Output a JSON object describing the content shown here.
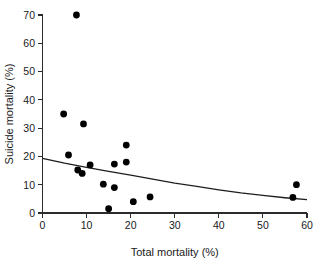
{
  "chart_data": {
    "type": "scatter",
    "title": "",
    "xlabel": "Total  mortality (%)",
    "ylabel": "Suicide mortality (%)",
    "xlim": [
      0,
      60
    ],
    "ylim": [
      0,
      70
    ],
    "xticks": [
      0,
      10,
      20,
      30,
      40,
      50,
      60
    ],
    "yticks": [
      0,
      10,
      20,
      30,
      40,
      50,
      60,
      70
    ],
    "xtick_labels": [
      "0",
      "10",
      "20",
      "30",
      "40",
      "50",
      "60"
    ],
    "ytick_labels": [
      "0",
      "10",
      "20",
      "30",
      "40",
      "50",
      "60",
      "70"
    ],
    "grid": false,
    "legend": null,
    "marker": "filled-circle",
    "marker_color": "#000000",
    "points": [
      {
        "x": 7.7,
        "y": 70.0
      },
      {
        "x": 4.8,
        "y": 35.0
      },
      {
        "x": 9.3,
        "y": 31.5
      },
      {
        "x": 19.0,
        "y": 24.0
      },
      {
        "x": 5.9,
        "y": 20.5
      },
      {
        "x": 19.0,
        "y": 18.0
      },
      {
        "x": 16.3,
        "y": 17.3
      },
      {
        "x": 10.8,
        "y": 17.0
      },
      {
        "x": 8.0,
        "y": 15.2
      },
      {
        "x": 9.0,
        "y": 14.0
      },
      {
        "x": 13.8,
        "y": 10.2
      },
      {
        "x": 16.3,
        "y": 9.0
      },
      {
        "x": 57.6,
        "y": 10.0
      },
      {
        "x": 24.4,
        "y": 5.7
      },
      {
        "x": 56.8,
        "y": 5.5
      },
      {
        "x": 20.6,
        "y": 4.0
      },
      {
        "x": 15.0,
        "y": 1.5
      }
    ],
    "fit_curve": {
      "name": "fitted-trend",
      "description": "decreasing-exponential-fit",
      "color": "#1d1d1d",
      "points": [
        {
          "x": 0,
          "y": 19.3
        },
        {
          "x": 5,
          "y": 17.6
        },
        {
          "x": 10,
          "y": 16.1
        },
        {
          "x": 15,
          "y": 14.7
        },
        {
          "x": 20,
          "y": 13.4
        },
        {
          "x": 25,
          "y": 12.0
        },
        {
          "x": 30,
          "y": 10.6
        },
        {
          "x": 35,
          "y": 9.4
        },
        {
          "x": 40,
          "y": 8.2
        },
        {
          "x": 45,
          "y": 7.1
        },
        {
          "x": 50,
          "y": 6.2
        },
        {
          "x": 55,
          "y": 5.4
        },
        {
          "x": 60,
          "y": 4.7
        }
      ]
    }
  }
}
